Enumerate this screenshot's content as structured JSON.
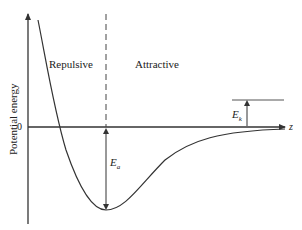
{
  "diagram": {
    "type": "potential energy curve",
    "y_axis_label": "Potential energy",
    "x_axis_label": "z",
    "zero_label": "0",
    "region_left": "Repulsive",
    "region_right": "Attractive",
    "well_depth_label_main": "E",
    "well_depth_label_sub": "a",
    "kinetic_label_main": "E",
    "kinetic_label_sub": "k",
    "colors": {
      "line": "#333333",
      "background": "#ffffff"
    }
  }
}
